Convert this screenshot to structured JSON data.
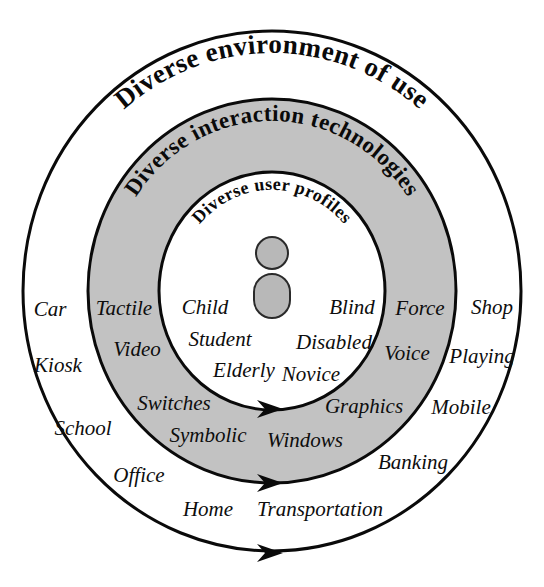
{
  "figure": {
    "title": "Diverse environment of use",
    "background_color": "#ffffff",
    "stroke_color": "#0a0a0a",
    "ring_fill_color": "#c2c2c2",
    "text_color": "#0d0d0d"
  },
  "rings": [
    {
      "id": "outer",
      "label": "Diverse environment of use",
      "fill": "#ffffff",
      "rx": 249,
      "ry": 260,
      "label_font_size": 27,
      "label_radius": 228
    },
    {
      "id": "middle",
      "label": "Diverse interaction technologies",
      "fill": "#c2c2c2",
      "rx": 184,
      "ry": 192,
      "label_font_size": 23,
      "label_radius": 163
    },
    {
      "id": "inner",
      "label": "Diverse user profiles",
      "fill": "#ffffff",
      "rx": 113,
      "ry": 119,
      "label_font_size": 18,
      "label_radius": 96
    }
  ],
  "center": {
    "cx": 272,
    "cy": 291
  },
  "person_icon": {
    "name": "person-icon",
    "fill": "#b8b8b8",
    "stroke": "#2a2a2a",
    "head_cx": 272,
    "head_cy": 253,
    "head_r": 16,
    "body_x": 254,
    "body_y": 274,
    "body_w": 36,
    "body_h": 44,
    "body_radius": 18
  },
  "terms": {
    "user_profiles": [
      {
        "label": "Child",
        "x": 205,
        "y": 309,
        "size": 21
      },
      {
        "label": "Student",
        "x": 220,
        "y": 341,
        "size": 21
      },
      {
        "label": "Elderly",
        "x": 244,
        "y": 372,
        "size": 21
      },
      {
        "label": "Novice",
        "x": 311,
        "y": 376,
        "size": 21
      },
      {
        "label": "Disabled",
        "x": 334,
        "y": 344,
        "size": 21
      },
      {
        "label": "Blind",
        "x": 352,
        "y": 309,
        "size": 21
      }
    ],
    "interaction_technologies": [
      {
        "label": "Tactile",
        "x": 124,
        "y": 310,
        "size": 21
      },
      {
        "label": "Video",
        "x": 137,
        "y": 351,
        "size": 21
      },
      {
        "label": "Switches",
        "x": 174,
        "y": 405,
        "size": 21
      },
      {
        "label": "Symbolic",
        "x": 208,
        "y": 437,
        "size": 21
      },
      {
        "label": "Windows",
        "x": 305,
        "y": 442,
        "size": 21
      },
      {
        "label": "Graphics",
        "x": 364,
        "y": 408,
        "size": 21
      },
      {
        "label": "Voice",
        "x": 407,
        "y": 355,
        "size": 21
      },
      {
        "label": "Force",
        "x": 420,
        "y": 310,
        "size": 21
      }
    ],
    "environment_of_use": [
      {
        "label": "Car",
        "x": 50,
        "y": 311,
        "size": 21
      },
      {
        "label": "Kiosk",
        "x": 58,
        "y": 367,
        "size": 21
      },
      {
        "label": "School",
        "x": 83,
        "y": 430,
        "size": 21
      },
      {
        "label": "Office",
        "x": 139,
        "y": 477,
        "size": 21
      },
      {
        "label": "Home",
        "x": 208,
        "y": 511,
        "size": 21
      },
      {
        "label": "Transportation",
        "x": 320,
        "y": 511,
        "size": 21
      },
      {
        "label": "Banking",
        "x": 413,
        "y": 464,
        "size": 21
      },
      {
        "label": "Mobile",
        "x": 461,
        "y": 409,
        "size": 21
      },
      {
        "label": "Playing",
        "x": 482,
        "y": 358,
        "size": 21
      },
      {
        "label": "Shop",
        "x": 492,
        "y": 309,
        "size": 21
      }
    ]
  },
  "arrows": [
    {
      "name": "inner-ring-arrow",
      "tip_x": 283,
      "tip_y": 409
    },
    {
      "name": "middle-ring-arrow",
      "tip_x": 283,
      "tip_y": 483
    },
    {
      "name": "outer-ring-arrow",
      "tip_x": 283,
      "tip_y": 553
    }
  ]
}
